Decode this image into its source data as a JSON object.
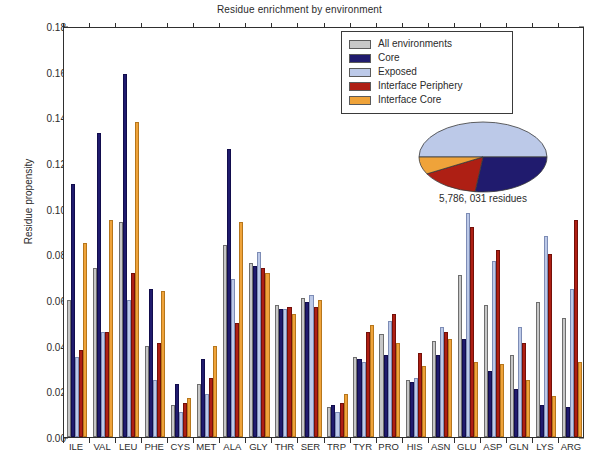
{
  "chart_data": {
    "type": "bar",
    "title": "Residue enrichment by environment",
    "xlabel": "",
    "ylabel": "Residue propensity",
    "ylim": [
      0.0,
      0.18
    ],
    "ytick_labels": [
      "0.00",
      "0.02",
      "0.04",
      "0.06",
      "0.08",
      "0.10",
      "0.12",
      "0.14",
      "0.16",
      "0.18"
    ],
    "ytick_values": [
      0.0,
      0.02,
      0.04,
      0.06,
      0.08,
      0.1,
      0.12,
      0.14,
      0.16,
      0.18
    ],
    "grid": false,
    "legend_position": "top-right",
    "categories": [
      "ILE",
      "VAL",
      "LEU",
      "PHE",
      "CYS",
      "MET",
      "ALA",
      "GLY",
      "THR",
      "SER",
      "TRP",
      "TYR",
      "PRO",
      "HIS",
      "ASN",
      "GLU",
      "ASP",
      "GLN",
      "LYS",
      "ARG"
    ],
    "series": [
      {
        "name": "All environments",
        "color": "#c7c7c7",
        "values": [
          0.06,
          0.074,
          0.094,
          0.04,
          0.014,
          0.023,
          0.084,
          0.076,
          0.058,
          0.061,
          0.013,
          0.035,
          0.045,
          0.025,
          0.042,
          0.071,
          0.058,
          0.036,
          0.059,
          0.052
        ]
      },
      {
        "name": "Core",
        "color": "#201b6e",
        "values": [
          0.111,
          0.133,
          0.159,
          0.065,
          0.023,
          0.034,
          0.126,
          0.075,
          0.056,
          0.059,
          0.014,
          0.034,
          0.036,
          0.024,
          0.036,
          0.043,
          0.029,
          0.021,
          0.014,
          0.013
        ]
      },
      {
        "name": "Exposed",
        "color": "#bcc9e8",
        "values": [
          0.035,
          0.046,
          0.06,
          0.025,
          0.011,
          0.019,
          0.069,
          0.081,
          0.056,
          0.062,
          0.011,
          0.033,
          0.051,
          0.026,
          0.048,
          0.098,
          0.077,
          0.048,
          0.088,
          0.065
        ]
      },
      {
        "name": "Interface Periphery",
        "color": "#ae1f14",
        "values": [
          0.038,
          0.046,
          0.072,
          0.041,
          0.015,
          0.026,
          0.05,
          0.074,
          0.057,
          0.057,
          0.015,
          0.046,
          0.054,
          0.037,
          0.046,
          0.092,
          0.082,
          0.041,
          0.08,
          0.095
        ]
      },
      {
        "name": "Interface Core",
        "color": "#efa33a",
        "values": [
          0.085,
          0.095,
          0.138,
          0.064,
          0.017,
          0.04,
          0.094,
          0.072,
          0.054,
          0.06,
          0.019,
          0.049,
          0.041,
          0.031,
          0.043,
          0.033,
          0.032,
          0.025,
          0.018,
          0.033
        ]
      }
    ],
    "inset_pie": {
      "type": "pie",
      "caption": "5,786, 031 residues",
      "slices": [
        {
          "label": "Exposed",
          "color": "#bcc9e8",
          "value": 50
        },
        {
          "label": "Core",
          "color": "#201b6e",
          "value": 27
        },
        {
          "label": "Interface Periphery",
          "color": "#ae1f14",
          "value": 15
        },
        {
          "label": "Interface Core",
          "color": "#efa33a",
          "value": 8
        }
      ]
    }
  },
  "colors": {
    "all_environments": "#c7c7c7",
    "core": "#201b6e",
    "exposed": "#bcc9e8",
    "interface_periphery": "#ae1f14",
    "interface_core": "#efa33a",
    "axis": "#2f2f2f",
    "background": "#ffffff"
  }
}
